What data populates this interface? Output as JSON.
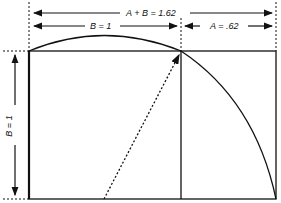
{
  "diagram": {
    "labels": {
      "total_width": "A + B = 1.62",
      "square_side": "B = 1",
      "remainder": "A = .62",
      "height": "B = 1"
    },
    "colors": {
      "line": "#111111",
      "background": "#ffffff"
    }
  }
}
